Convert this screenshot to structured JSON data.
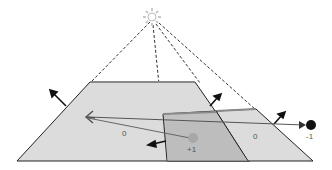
{
  "labels": {
    "left_region": "0",
    "right_region": "0",
    "inner_point": "+1",
    "outer_point": "-1"
  },
  "colors": {
    "fill_light": "#dcdcdc",
    "fill_mid": "#c8c8c8",
    "fill_dark": "#b8b8b8",
    "top_edge": "#8a8a8a",
    "line": "#222222",
    "inner_point": "#a8a8a8",
    "outer_point": "#111111"
  },
  "icons": {
    "light_source": "sun-icon",
    "viewer": "eye-icon"
  }
}
